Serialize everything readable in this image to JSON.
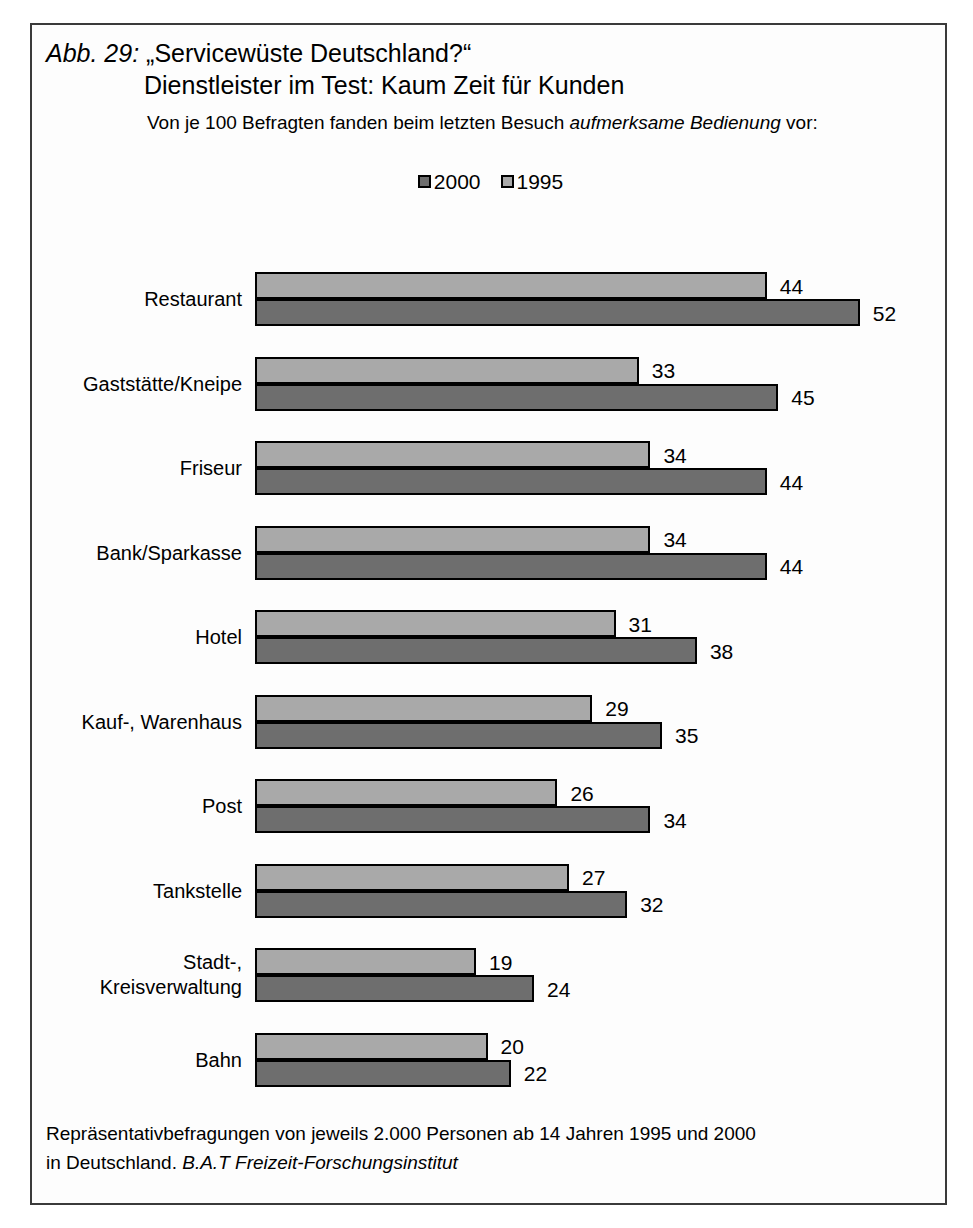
{
  "figure": {
    "number_label": "Abb. 29:",
    "title_line1": "„Servicewüste Deutschland?“",
    "title_line2": "Dienstleister im Test: Kaum Zeit für Kunden",
    "subtitle_prefix": "Von je 100 Befragten fanden beim letzten Besuch ",
    "subtitle_emphasis": "aufmerksame Bedienung",
    "subtitle_suffix": " vor:",
    "footer_line1": "Repräsentativbefragungen von jeweils 2.000 Personen ab 14 Jahren 1995 und 2000",
    "footer_line2_prefix": "in Deutschland. ",
    "footer_line2_emphasis": "B.A.T Freizeit-Forschungsinstitut"
  },
  "legend": {
    "entries": [
      {
        "label": "2000",
        "color": "#6e6e6e"
      },
      {
        "label": "1995",
        "color": "#a9a9a9"
      }
    ]
  },
  "colors": {
    "series_2000": "#6e6e6e",
    "series_1995": "#a9a9a9",
    "frame": "#3a3a3a",
    "background": "#fdfdfd"
  },
  "chart_data": {
    "type": "bar",
    "orientation": "horizontal",
    "subtitle": "Von je 100 Befragten fanden beim letzten Besuch aufmerksame Bedienung vor:",
    "xlabel": "",
    "ylabel": "",
    "xlim": [
      0,
      52
    ],
    "grid": false,
    "legend_position": "top-center",
    "categories": [
      "Restaurant",
      "Gaststätte/Kneipe",
      "Friseur",
      "Bank/Sparkasse",
      "Hotel",
      "Kauf-, Warenhaus",
      "Post",
      "Tankstelle",
      "Stadt-,\nKreisverwaltung",
      "Bahn"
    ],
    "series": [
      {
        "name": "1995",
        "color": "#a9a9a9",
        "values": [
          44,
          33,
          34,
          34,
          31,
          29,
          26,
          27,
          19,
          20
        ]
      },
      {
        "name": "2000",
        "color": "#6e6e6e",
        "values": [
          52,
          45,
          44,
          44,
          38,
          35,
          34,
          32,
          24,
          22
        ]
      }
    ],
    "source": "Repräsentativbefragungen von jeweils 2.000 Personen ab 14 Jahren 1995 und 2000 in Deutschland. B.A.T Freizeit-Forschungsinstitut"
  }
}
